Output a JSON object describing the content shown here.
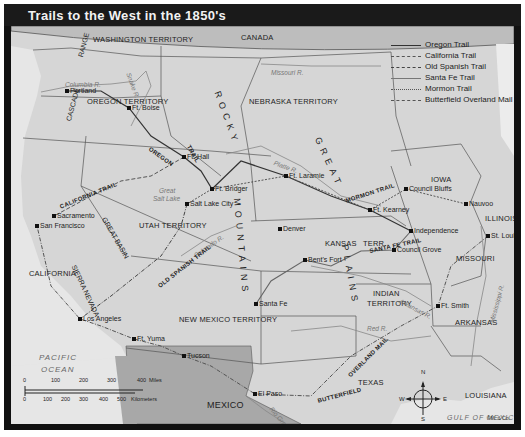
{
  "title": "Trails to the West in the 1850's",
  "legend": [
    {
      "label": "Oregon Trail",
      "style": "solid",
      "color": "#333333"
    },
    {
      "label": "California Trail",
      "style": "dashed",
      "color": "#555555"
    },
    {
      "label": "Old Spanish Trail",
      "style": "dash-dot",
      "color": "#444444"
    },
    {
      "label": "Santa Fe Trail",
      "style": "solid",
      "color": "#666666"
    },
    {
      "label": "Mormon Trail",
      "style": "dotted",
      "color": "#555555"
    },
    {
      "label": "Butterfield Overland Mail",
      "style": "dash-dot",
      "color": "#555555"
    }
  ],
  "regions": {
    "canada": "CANADA",
    "washington": "WASHINGTON TERRITORY",
    "oregon": "OREGON TERRITORY",
    "nebraska": "NEBRASKA TERRITORY",
    "utah": "UTAH TERRITORY",
    "california": "CALIFORNIA",
    "new_mexico": "NEW MEXICO TERRITORY",
    "kansas": "KANSAS",
    "kansas_terr": "TERR.",
    "indian_1": "INDIAN",
    "indian_2": "TERRITORY",
    "iowa": "IOWA",
    "illinois": "ILLINOIS",
    "missouri": "MISSOURI",
    "arkansas": "ARKANSAS",
    "louisiana": "LOUISIANA",
    "texas": "TEXAS",
    "mexico": "MEXICO"
  },
  "physical": {
    "cascade": "CASCADE",
    "range": "RANGE",
    "rocky": "ROCKY",
    "mountains": "MOUNTAINS",
    "great": "GREAT",
    "plains": "PLAINS",
    "great_basin": "GREAT BASIN",
    "sierra_nevada": "SIERRA NEVADA",
    "great_salt_lake_1": "Great",
    "great_salt_lake_2": "Salt Lake"
  },
  "water": {
    "pacific_1": "PACIFIC",
    "pacific_2": "OCEAN",
    "gulf": "GULF OF MEXICO"
  },
  "rivers": {
    "columbia": "Columbia R.",
    "snake": "Snake R.",
    "missouri": "Missouri R.",
    "platte": "Platte R.",
    "colorado": "Colorado R.",
    "arkansas": "Arkansas R.",
    "red": "Red R.",
    "rio_grande": "Rio Grande",
    "mississippi": "Mississippi R."
  },
  "trail_labels": {
    "oregon_1": "OREGON",
    "oregon_2": "TRAIL",
    "california": "CALIFORNIA TRAIL",
    "mormon": "MORMON TRAIL",
    "santa_fe": "SANTA FE TRAIL",
    "old_spanish": "OLD SPANISH TRAIL",
    "butterfield_1": "BUTTERFIELD",
    "butterfield_2": "OVERLAND MAIL"
  },
  "places": [
    {
      "name": "Portland",
      "x": 56,
      "y": 65
    },
    {
      "name": "Ft. Boise",
      "x": 118,
      "y": 82
    },
    {
      "name": "Ft. Hall",
      "x": 173,
      "y": 131
    },
    {
      "name": "Ft. Bridger",
      "x": 201,
      "y": 163
    },
    {
      "name": "Ft. Laramie",
      "x": 275,
      "y": 150
    },
    {
      "name": "Salt Lake City",
      "x": 176,
      "y": 178
    },
    {
      "name": "Sacramento",
      "x": 43,
      "y": 190
    },
    {
      "name": "San Francisco",
      "x": 26,
      "y": 200
    },
    {
      "name": "Denver",
      "x": 269,
      "y": 203
    },
    {
      "name": "Bent's Fort",
      "x": 294,
      "y": 234
    },
    {
      "name": "Ft. Kearney",
      "x": 359,
      "y": 184
    },
    {
      "name": "Council Bluffs",
      "x": 395,
      "y": 163
    },
    {
      "name": "Nauvoo",
      "x": 455,
      "y": 178
    },
    {
      "name": "Independence",
      "x": 400,
      "y": 205
    },
    {
      "name": "St. Louis",
      "x": 477,
      "y": 210
    },
    {
      "name": "Council Grove",
      "x": 383,
      "y": 224
    },
    {
      "name": "Santa Fe",
      "x": 245,
      "y": 278
    },
    {
      "name": "Ft. Smith",
      "x": 427,
      "y": 280
    },
    {
      "name": "Los Angeles",
      "x": 69,
      "y": 293
    },
    {
      "name": "Ft. Yuma",
      "x": 123,
      "y": 313
    },
    {
      "name": "Tucson",
      "x": 173,
      "y": 330
    },
    {
      "name": "El Paso",
      "x": 244,
      "y": 368
    }
  ],
  "compass": {
    "n": "N",
    "s": "S",
    "e": "E",
    "w": "W"
  },
  "scale": {
    "miles_ticks": [
      "0",
      "100",
      "200",
      "300",
      "400"
    ],
    "miles_unit": "Miles",
    "km_ticks": [
      "0",
      "100",
      "200",
      "300",
      "400",
      "500"
    ],
    "km_unit": "Kilometers"
  },
  "copyright": "©M. & Co."
}
